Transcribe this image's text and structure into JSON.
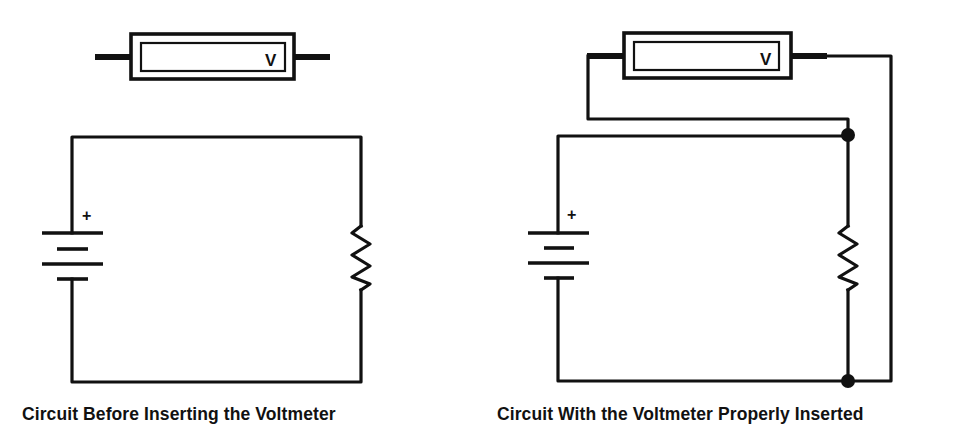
{
  "diagram": {
    "colors": {
      "ink": "#111111",
      "background": "#ffffff"
    },
    "left_panel": {
      "caption": "Circuit Before Inserting the Voltmeter",
      "voltmeter": {
        "label": "V",
        "connected": false
      },
      "battery": {
        "polarity_mark": "+",
        "cells": 2
      },
      "resistor": {
        "label": "resistor"
      },
      "junctions": 0
    },
    "right_panel": {
      "caption": "Circuit With the Voltmeter Properly Inserted",
      "voltmeter": {
        "label": "V",
        "connected": true,
        "connection": "parallel across resistor"
      },
      "battery": {
        "polarity_mark": "+",
        "cells": 2
      },
      "resistor": {
        "label": "resistor"
      },
      "junctions": 2
    }
  }
}
